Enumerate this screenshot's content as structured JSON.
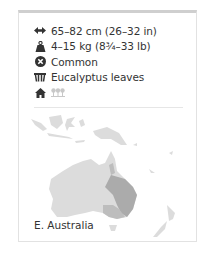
{
  "facts": {
    "length": {
      "icon": "length-arrows-icon",
      "text": "65–82 cm (26–32 in)"
    },
    "weight": {
      "icon": "weight-icon",
      "text": "4–15 kg (8¾–33 lb)"
    },
    "status": {
      "icon": "conservation-status-icon",
      "text": "Common"
    },
    "diet": {
      "icon": "diet-leaves-icon",
      "text": "Eucalyptus leaves"
    },
    "habitat": {
      "icons": [
        "habitat-home-icon",
        "forest-habitat-icon"
      ]
    }
  },
  "map": {
    "label": "E. Australia",
    "colors": {
      "land": "#d9d9d9",
      "range": "#a9a9a9",
      "range_south": "#bcbcbc"
    }
  },
  "colors": {
    "text": "#333333",
    "icon": "#333333",
    "icon_faded": "#c8c8c8",
    "border_top": "#cfcfcf",
    "border": "#e2e2e2"
  }
}
